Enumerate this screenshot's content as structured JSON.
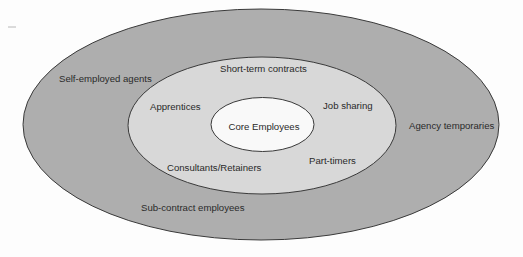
{
  "colors": {
    "background": "#fdfdfd",
    "outer_ring": "#aeaeae",
    "middle_ring": "#d8d8d8",
    "core": "#f9f9f9",
    "stroke": "#3a3a3a",
    "text": "#2a2a2a"
  },
  "rings": {
    "core": {
      "label": "Core Employees"
    },
    "middle": {
      "labels": [
        "Short-term contracts",
        "Apprentices",
        "Job sharing",
        "Consultants/Retainers",
        "Part-timers"
      ]
    },
    "outer": {
      "labels": [
        "Self-employed agents",
        "Agency temporaries",
        "Sub-contract employees"
      ]
    }
  }
}
